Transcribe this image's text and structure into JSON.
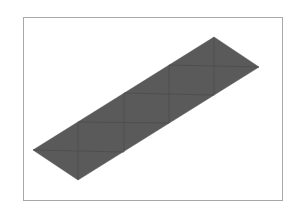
{
  "figure": {
    "frame": {
      "x": 23,
      "y": 17,
      "width": 260,
      "height": 184,
      "border_color": "#a8a8a8"
    },
    "strip": {
      "fill_color": "#5a5a5a",
      "mesh_line_color": "#4a4a4a",
      "outline": "33,150 214,37 259,67 78,180",
      "cells": 4,
      "mesh_lines": [
        {
          "x1": 78,
          "y1": 122,
          "x2": 78,
          "y2": 180
        },
        {
          "x1": 124,
          "y1": 93,
          "x2": 124,
          "y2": 152
        },
        {
          "x1": 169,
          "y1": 65,
          "x2": 169,
          "y2": 123
        },
        {
          "x1": 214,
          "y1": 37,
          "x2": 214,
          "y2": 95
        },
        {
          "x1": 33,
          "y1": 150,
          "x2": 124,
          "y2": 152
        },
        {
          "x1": 78,
          "y1": 122,
          "x2": 169,
          "y2": 123
        },
        {
          "x1": 124,
          "y1": 93,
          "x2": 214,
          "y2": 95
        },
        {
          "x1": 169,
          "y1": 65,
          "x2": 259,
          "y2": 67
        }
      ]
    }
  }
}
